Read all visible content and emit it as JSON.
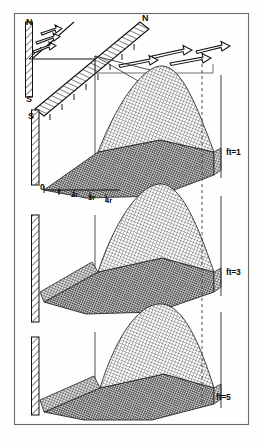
{
  "figure": {
    "frame_color": "#5a5a5a",
    "ink_color": "#111111",
    "mesh_color": "#3a3a3a",
    "dark_fill": "#6e6e6e",
    "light_fill": "#fbfbfb"
  },
  "orientation": {
    "inset_north_label": "N",
    "inset_south_label": "S",
    "main_north_label": "N",
    "main_south_label": "S"
  },
  "panels": [
    {
      "label": "ft=1"
    },
    {
      "label": "ft=3"
    },
    {
      "label": "ft=5"
    }
  ],
  "axis": {
    "origin_label": "0",
    "ticks": [
      {
        "label": "r"
      },
      {
        "label": "2r"
      },
      {
        "label": "3r"
      },
      {
        "label": "4r"
      }
    ]
  },
  "arrows": {
    "inset_count": 3,
    "main_count": 4,
    "direction": "eastward",
    "style": "open-outline-vector"
  },
  "icons": {
    "hatched_wall": "hatched-wall-icon",
    "vector_arrow": "vector-arrow-icon",
    "mesh_surface": "mesh-surface-icon",
    "dashed_reference": "dashed-reference-line-icon"
  }
}
